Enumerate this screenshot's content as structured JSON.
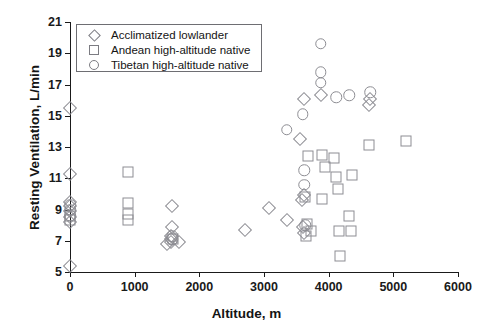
{
  "chart_data": {
    "type": "scatter",
    "title": "",
    "xlabel": "Altitude, m",
    "ylabel": "Resting Ventilation, L/min",
    "xlim": [
      0,
      6000
    ],
    "ylim": [
      5,
      21
    ],
    "xticks": [
      0,
      1000,
      2000,
      3000,
      4000,
      5000,
      6000
    ],
    "yticks": [
      5,
      7,
      9,
      11,
      13,
      15,
      17,
      19,
      21
    ],
    "grid": false,
    "legend_position": "top-left",
    "series": [
      {
        "name": "Acclimatized lowlander",
        "marker": "diamond",
        "points": [
          [
            0,
            15.5
          ],
          [
            0,
            11.3
          ],
          [
            0,
            9.5
          ],
          [
            0,
            9.2
          ],
          [
            0,
            8.9
          ],
          [
            0,
            8.5
          ],
          [
            0,
            8.2
          ],
          [
            0,
            5.4
          ],
          [
            1580,
            9.2
          ],
          [
            1580,
            7.9
          ],
          [
            1560,
            7.3
          ],
          [
            1560,
            7.1
          ],
          [
            1560,
            6.9
          ],
          [
            1500,
            6.8
          ],
          [
            1680,
            6.9
          ],
          [
            3080,
            9.1
          ],
          [
            3560,
            13.5
          ],
          [
            3580,
            9.6
          ],
          [
            3620,
            9.9
          ],
          [
            3600,
            7.9
          ],
          [
            3620,
            7.5
          ],
          [
            3360,
            8.3
          ],
          [
            3620,
            16.1
          ],
          [
            3880,
            16.3
          ],
          [
            4640,
            16.1
          ],
          [
            4620,
            15.7
          ],
          [
            2700,
            7.7
          ]
        ]
      },
      {
        "name": "Andean high-altitude native",
        "marker": "square",
        "points": [
          [
            0,
            8.6
          ],
          [
            0,
            8.3
          ],
          [
            900,
            11.4
          ],
          [
            900,
            9.4
          ],
          [
            900,
            8.7
          ],
          [
            900,
            8.3
          ],
          [
            1600,
            7.1
          ],
          [
            3640,
            9.8
          ],
          [
            3650,
            7.3
          ],
          [
            3660,
            8.1
          ],
          [
            3680,
            12.4
          ],
          [
            3900,
            9.7
          ],
          [
            3900,
            12.5
          ],
          [
            3940,
            11.7
          ],
          [
            4080,
            12.3
          ],
          [
            4120,
            11.1
          ],
          [
            4150,
            10.3
          ],
          [
            4160,
            7.6
          ],
          [
            4180,
            6.0
          ],
          [
            4320,
            8.6
          ],
          [
            4340,
            7.6
          ],
          [
            4360,
            11.2
          ],
          [
            4620,
            13.1
          ],
          [
            5200,
            13.4
          ],
          [
            3720,
            7.6
          ]
        ]
      },
      {
        "name": "Tibetan high-altitude native",
        "marker": "circle",
        "points": [
          [
            0,
            9.3
          ],
          [
            0,
            9.0
          ],
          [
            0,
            8.6
          ],
          [
            1580,
            7.3
          ],
          [
            1580,
            7.1
          ],
          [
            3350,
            14.1
          ],
          [
            3600,
            15.1
          ],
          [
            3620,
            11.5
          ],
          [
            3620,
            10.6
          ],
          [
            3640,
            8.0
          ],
          [
            3880,
            19.6
          ],
          [
            3880,
            17.8
          ],
          [
            3880,
            17.1
          ],
          [
            4120,
            16.2
          ],
          [
            4320,
            16.3
          ],
          [
            4640,
            16.5
          ]
        ]
      }
    ]
  },
  "legend": {
    "items": [
      {
        "label": "Acclimatized lowlander",
        "marker": "diamond"
      },
      {
        "label": "Andean high-altitude native",
        "marker": "square"
      },
      {
        "label": "Tibetan high-altitude native",
        "marker": "circle"
      }
    ]
  }
}
